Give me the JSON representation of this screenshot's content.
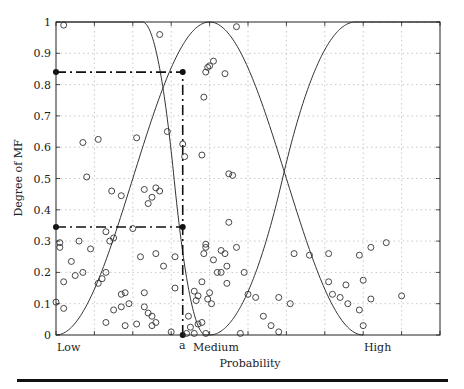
{
  "chart_data": {
    "type": "line",
    "title": "",
    "xlabel": "Probability",
    "ylabel": "Degree of MF",
    "xlim": [
      0,
      1
    ],
    "ylim": [
      0,
      1
    ],
    "grid": true,
    "x_tick_labels": [
      {
        "label": "Low",
        "x": 0.0
      },
      {
        "label": "a",
        "x": 0.33
      },
      {
        "label": "Medium",
        "x": 0.4
      },
      {
        "label": "High",
        "x": 0.8
      }
    ],
    "y_ticks": [
      0,
      0.1,
      0.2,
      0.3,
      0.4,
      0.5,
      0.6,
      0.7,
      0.8,
      0.9,
      1
    ],
    "y_tick_labels": [
      "0",
      "0.1",
      "0.2",
      "0.3",
      "0.4",
      "0.5",
      "0.6",
      "0.7",
      "0.8",
      "0.9",
      "1"
    ],
    "series": [
      {
        "name": "Low MF",
        "shape": "z-shaped",
        "x": [
          0,
          0.225,
          0.26,
          0.3,
          0.33,
          0.36,
          0.385,
          0.39
        ],
        "y": [
          1,
          1,
          0.9,
          0.62,
          0.345,
          0.12,
          0.02,
          0
        ]
      },
      {
        "name": "Medium MF",
        "shape": "bell",
        "x": [
          0,
          0.1,
          0.2,
          0.26,
          0.3,
          0.33,
          0.36,
          0.4,
          0.45,
          0.5,
          0.55,
          0.6,
          0.65,
          0.7,
          0.75,
          0.8
        ],
        "y": [
          0,
          0.03,
          0.13,
          0.3,
          0.5,
          0.84,
          0.95,
          1,
          0.96,
          0.83,
          0.62,
          0.4,
          0.2,
          0.07,
          0.01,
          0
        ]
      },
      {
        "name": "High MF",
        "shape": "s-shaped",
        "x": [
          0.4,
          0.45,
          0.5,
          0.55,
          0.6,
          0.65,
          0.7,
          0.75,
          0.78,
          1
        ],
        "y": [
          0,
          0.03,
          0.12,
          0.26,
          0.43,
          0.62,
          0.8,
          0.95,
          1,
          1
        ]
      }
    ],
    "annotations": {
      "a_x": 0.33,
      "mu_low_at_a": 0.345,
      "mu_medium_at_a": 0.84,
      "dashdot_lines": [
        {
          "from": [
            0,
            0.84
          ],
          "to": [
            0.33,
            0.84
          ]
        },
        {
          "from": [
            0,
            0.345
          ],
          "to": [
            0.33,
            0.345
          ]
        },
        {
          "from": [
            0.33,
            0
          ],
          "to": [
            0.33,
            0.84
          ]
        }
      ]
    },
    "scatter": [
      [
        0.02,
        0.99
      ],
      [
        0.07,
        0.615
      ],
      [
        0.27,
        0.96
      ],
      [
        0.47,
        0.985
      ],
      [
        0.39,
        0.84
      ],
      [
        0.4,
        0.86
      ],
      [
        0.41,
        0.875
      ],
      [
        0.44,
        0.835
      ],
      [
        0.385,
        0.76
      ],
      [
        0.395,
        0.855
      ],
      [
        0.21,
        0.63
      ],
      [
        0.11,
        0.625
      ],
      [
        0.08,
        0.505
      ],
      [
        0.29,
        0.65
      ],
      [
        0.33,
        0.61
      ],
      [
        0.335,
        0.57
      ],
      [
        0.38,
        0.575
      ],
      [
        0.45,
        0.515
      ],
      [
        0.46,
        0.51
      ],
      [
        0.27,
        0.46
      ],
      [
        0.23,
        0.465
      ],
      [
        0.25,
        0.44
      ],
      [
        0.24,
        0.42
      ],
      [
        0.17,
        0.445
      ],
      [
        0.145,
        0.46
      ],
      [
        0.26,
        0.47
      ],
      [
        0.01,
        0.295
      ],
      [
        0.01,
        0.28
      ],
      [
        0.06,
        0.3
      ],
      [
        0.13,
        0.33
      ],
      [
        0.14,
        0.3
      ],
      [
        0.15,
        0.31
      ],
      [
        0.09,
        0.275
      ],
      [
        0.04,
        0.235
      ],
      [
        0.22,
        0.25
      ],
      [
        0.2,
        0.34
      ],
      [
        0.02,
        0.17
      ],
      [
        0.05,
        0.19
      ],
      [
        0.07,
        0.2
      ],
      [
        0.12,
        0.18
      ],
      [
        0.13,
        0.2
      ],
      [
        0.11,
        0.165
      ],
      [
        0.18,
        0.135
      ],
      [
        0.17,
        0.13
      ],
      [
        0.23,
        0.135
      ],
      [
        0.26,
        0.26
      ],
      [
        0.31,
        0.25
      ],
      [
        0.28,
        0.22
      ],
      [
        0.31,
        0.15
      ],
      [
        0.0,
        0.105
      ],
      [
        0.02,
        0.085
      ],
      [
        0.19,
        0.1
      ],
      [
        0.17,
        0.09
      ],
      [
        0.23,
        0.09
      ],
      [
        0.24,
        0.07
      ],
      [
        0.25,
        0.06
      ],
      [
        0.13,
        0.04
      ],
      [
        0.21,
        0.035
      ],
      [
        0.18,
        0.03
      ],
      [
        0.26,
        0.04
      ],
      [
        0.25,
        0.03
      ],
      [
        0.15,
        0.08
      ],
      [
        0.35,
        0.025
      ],
      [
        0.37,
        0.035
      ],
      [
        0.38,
        0.04
      ],
      [
        0.345,
        0.06
      ],
      [
        0.39,
        0.29
      ],
      [
        0.39,
        0.28
      ],
      [
        0.385,
        0.26
      ],
      [
        0.42,
        0.2
      ],
      [
        0.41,
        0.24
      ],
      [
        0.43,
        0.27
      ],
      [
        0.445,
        0.22
      ],
      [
        0.445,
        0.165
      ],
      [
        0.38,
        0.17
      ],
      [
        0.4,
        0.135
      ],
      [
        0.405,
        0.1
      ],
      [
        0.395,
        0.115
      ],
      [
        0.36,
        0.14
      ],
      [
        0.365,
        0.11
      ],
      [
        0.37,
        0.125
      ],
      [
        0.44,
        0.26
      ],
      [
        0.45,
        0.36
      ],
      [
        0.47,
        0.28
      ],
      [
        0.49,
        0.2
      ],
      [
        0.5,
        0.13
      ],
      [
        0.52,
        0.12
      ],
      [
        0.54,
        0.06
      ],
      [
        0.43,
        0.2
      ],
      [
        0.34,
        0.005
      ],
      [
        0.3,
        0.01
      ],
      [
        0.36,
        0.005
      ],
      [
        0.56,
        0.03
      ],
      [
        0.58,
        0.01
      ],
      [
        0.62,
        0.26
      ],
      [
        0.61,
        0.1
      ],
      [
        0.66,
        0.255
      ],
      [
        0.71,
        0.26
      ],
      [
        0.71,
        0.17
      ],
      [
        0.72,
        0.13
      ],
      [
        0.74,
        0.12
      ],
      [
        0.755,
        0.16
      ],
      [
        0.76,
        0.1
      ],
      [
        0.79,
        0.255
      ],
      [
        0.8,
        0.175
      ],
      [
        0.82,
        0.28
      ],
      [
        0.82,
        0.115
      ],
      [
        0.86,
        0.295
      ],
      [
        0.9,
        0.125
      ],
      [
        0.79,
        0.08
      ],
      [
        0.8,
        0.03
      ],
      [
        0.58,
        0.12
      ],
      [
        0.48,
        0.005
      ],
      [
        0.39,
        0.005
      ]
    ]
  },
  "labels": {
    "ylabel": "Degree of MF",
    "xlabel": "Probability",
    "low": "Low",
    "a": "a",
    "medium": "Medium",
    "high": "High"
  }
}
